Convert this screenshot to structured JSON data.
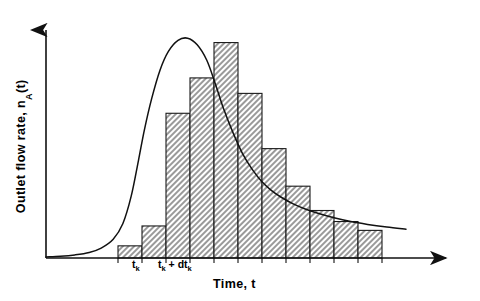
{
  "figure": {
    "title": "",
    "ylabel_text": "Outlet flow rate, n",
    "ylabel_sub": "A",
    "ylabel_tail": "(t)",
    "xlabel": "Time, t",
    "tick_labels": [
      {
        "name": "t-k",
        "base": "t",
        "sub": "k",
        "tail": ""
      },
      {
        "name": "t-k-plus-dt-k",
        "base": "t",
        "sub": "k",
        "tail": " + dt",
        "sub2": "k"
      }
    ]
  },
  "chart_data": {
    "type": "bar",
    "title": "",
    "xlabel": "Time, t",
    "ylabel": "Outlet flow rate, n_A(t)",
    "grid": false,
    "legend": null,
    "xlim": [
      0,
      16
    ],
    "ylim": [
      0,
      1.05
    ],
    "x_tick_positions": [
      4,
      5
    ],
    "x_tick_labels": [
      "t_k",
      "t_k + dt_k"
    ],
    "bar_edges": [
      3,
      4,
      5,
      6,
      7,
      8,
      9,
      10,
      11,
      12,
      13,
      14
    ],
    "categories": [
      "b1",
      "b2",
      "b3",
      "b4",
      "b5",
      "b6",
      "b7",
      "b8",
      "b9",
      "b10",
      "b11"
    ],
    "values": [
      0.055,
      0.145,
      0.655,
      0.815,
      0.975,
      0.745,
      0.495,
      0.325,
      0.215,
      0.165,
      0.125
    ],
    "bar_facecolor": "#d0d0d0",
    "bar_edgecolor": "#1a1a1a",
    "bar_hatch": "cross-diagonal",
    "curve": {
      "name": "outlet-flow-rate-curve",
      "style": "smooth-line",
      "color": "#111111",
      "x": [
        0.0,
        0.6,
        1.2,
        1.8,
        2.3,
        2.8,
        3.2,
        3.55,
        3.85,
        4.1,
        4.4,
        4.75,
        5.1,
        5.5,
        5.9,
        6.3,
        6.7,
        7.05,
        7.4,
        7.8,
        8.2,
        8.6,
        9.0,
        9.4,
        9.8,
        10.3,
        10.8,
        11.4,
        12.0,
        12.7,
        13.4,
        14.2,
        15.0
      ],
      "y": [
        0.005,
        0.008,
        0.014,
        0.025,
        0.045,
        0.085,
        0.155,
        0.28,
        0.44,
        0.58,
        0.72,
        0.85,
        0.935,
        0.985,
        0.995,
        0.965,
        0.895,
        0.79,
        0.675,
        0.565,
        0.47,
        0.4,
        0.345,
        0.305,
        0.275,
        0.245,
        0.222,
        0.2,
        0.182,
        0.165,
        0.152,
        0.14,
        0.13
      ]
    }
  }
}
